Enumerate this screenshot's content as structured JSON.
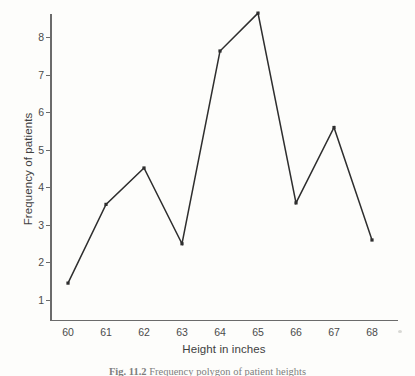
{
  "figure": {
    "caption_number": "Fig. 11.2",
    "caption_text": "Frequency polygon of patient heights"
  },
  "chart_data": {
    "type": "line",
    "title": "",
    "xlabel": "Height in inches",
    "ylabel": "Frequency of patients",
    "categories": [
      "60",
      "61",
      "62",
      "63",
      "64",
      "65",
      "66",
      "67",
      "68"
    ],
    "x": [
      60,
      61,
      62,
      63,
      64,
      65,
      66,
      67,
      68
    ],
    "values": [
      1.45,
      3.55,
      4.52,
      2.5,
      7.64,
      8.65,
      3.59,
      5.6,
      2.6
    ],
    "series": [
      {
        "name": "Frequency of patients",
        "values": [
          1.45,
          3.55,
          4.52,
          2.5,
          7.64,
          8.65,
          3.59,
          5.6,
          2.6
        ],
        "color": "#2e2e2e",
        "marker": "square"
      }
    ],
    "xlim": [
      59.55,
      68.6
    ],
    "ylim": [
      0.6,
      8.9
    ],
    "yticks": [
      1,
      2,
      3,
      4,
      5,
      6,
      7,
      8
    ],
    "ytick_labels": [
      "1",
      "2",
      "3",
      "4",
      "5",
      "6",
      "7",
      "8"
    ],
    "xticks": [
      60,
      61,
      62,
      63,
      64,
      65,
      66,
      67,
      68
    ],
    "xtick_labels": [
      "60",
      "61",
      "62",
      "63",
      "64",
      "65",
      "66",
      "67",
      "68"
    ],
    "grid": false,
    "legend": false,
    "legend_position": "none",
    "line_color": "#2e2e2e",
    "axis_color": "#6b6b6b",
    "background_color": "#fdfdfb"
  }
}
